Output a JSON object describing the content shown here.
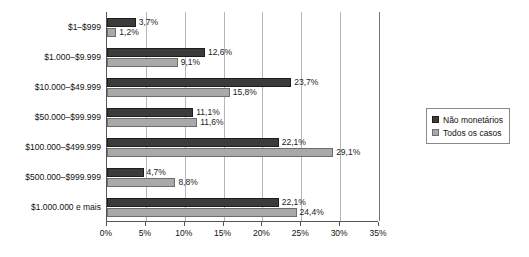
{
  "chart_data": {
    "type": "bar",
    "orientation": "horizontal",
    "title": "",
    "xlabel": "",
    "ylabel": "",
    "xlim": [
      0,
      35
    ],
    "xticks": [
      "0%",
      "5%",
      "10%",
      "15%",
      "20%",
      "25%",
      "30%",
      "35%"
    ],
    "xtick_values": [
      0,
      5,
      10,
      15,
      20,
      25,
      30,
      35
    ],
    "grid": true,
    "legend_position": "right",
    "categories": [
      "$1–$999",
      "$1.000–$9.999",
      "$10.000–$49.999",
      "$50.000–$99.999",
      "$100.000–$499.999",
      "$500.000–$999.999",
      "$1.000.000 e mais"
    ],
    "series": [
      {
        "name": "Não monetários",
        "color": "#3b3b3b",
        "values": [
          3.7,
          12.6,
          23.7,
          11.1,
          22.1,
          4.7,
          22.1
        ],
        "labels": [
          "3,7%",
          "12,6%",
          "23,7%",
          "11,1%",
          "22,1%",
          "4,7%",
          "22,1%"
        ]
      },
      {
        "name": "Todos os casos",
        "color": "#a9a9a9",
        "values": [
          1.2,
          9.1,
          15.8,
          11.6,
          29.1,
          8.8,
          24.4
        ],
        "labels": [
          "1,2%",
          "9,1%",
          "15,8%",
          "11,6%",
          "29,1%",
          "8,8%",
          "24,4%"
        ]
      }
    ]
  },
  "legend": {
    "items": [
      {
        "label": "Não monetários",
        "swatch": "dark"
      },
      {
        "label": "Todos os casos",
        "swatch": "light"
      }
    ]
  }
}
